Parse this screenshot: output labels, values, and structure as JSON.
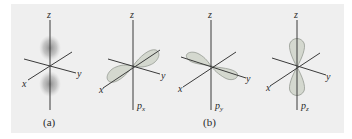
{
  "figure": {
    "background": "#efefef",
    "lobe_color": "#d4d8cf",
    "panels": [
      {
        "id": "s",
        "axes": {
          "x": "x",
          "y": "y",
          "z": "z"
        },
        "orbital_label": "",
        "orbital_sub": "",
        "style": "density-cloud"
      },
      {
        "id": "px",
        "axes": {
          "x": "x",
          "y": "y",
          "z": "z"
        },
        "orbital_label": "p",
        "orbital_sub": "x",
        "style": "lobes"
      },
      {
        "id": "py",
        "axes": {
          "x": "x",
          "y": "y",
          "z": "z"
        },
        "orbital_label": "p",
        "orbital_sub": "y",
        "style": "lobes"
      },
      {
        "id": "pz",
        "axes": {
          "x": "x",
          "y": "y",
          "z": "z"
        },
        "orbital_label": "p",
        "orbital_sub": "z",
        "style": "lobes"
      }
    ],
    "captions": {
      "a": "(a)",
      "b": "(b)"
    }
  }
}
